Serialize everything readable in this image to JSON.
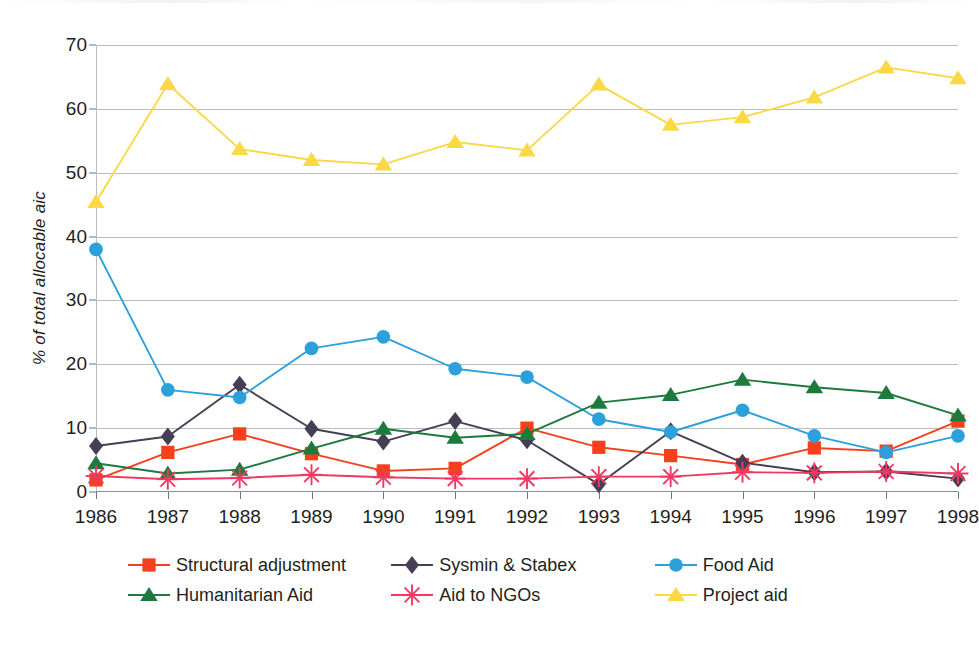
{
  "chart_data": {
    "type": "line",
    "title": "",
    "xlabel": "",
    "ylabel": "% of total allocable aic",
    "categories": [
      "1986",
      "1987",
      "1988",
      "1989",
      "1990",
      "1991",
      "1992",
      "1993",
      "1994",
      "1995",
      "1996",
      "1997",
      "1998"
    ],
    "ylim": [
      0,
      70
    ],
    "yticks": [
      0,
      10,
      20,
      30,
      40,
      50,
      60,
      70
    ],
    "grid": true,
    "legend_position": "bottom",
    "series": [
      {
        "name": "Structural adjustment",
        "color": "#F4401C",
        "marker": "square",
        "values": [
          1.9,
          6.2,
          9.1,
          6.0,
          3.3,
          3.7,
          10.0,
          7.0,
          5.7,
          4.3,
          6.9,
          6.4,
          11.1
        ]
      },
      {
        "name": "Sysmin & Stabex",
        "color": "#463E54",
        "marker": "diamond",
        "values": [
          7.2,
          8.7,
          16.8,
          9.9,
          7.9,
          11.1,
          8.1,
          1.2,
          9.5,
          4.6,
          3.1,
          3.2,
          2.1
        ]
      },
      {
        "name": "Food Aid",
        "color": "#2BA0DB",
        "marker": "circle",
        "values": [
          38.0,
          16.0,
          14.8,
          22.5,
          24.3,
          19.3,
          18.0,
          11.4,
          9.4,
          12.8,
          8.8,
          6.2,
          8.8
        ]
      },
      {
        "name": "Humanitarian Aid",
        "color": "#1E7A3C",
        "marker": "triangle",
        "values": [
          4.5,
          2.9,
          3.5,
          6.8,
          9.9,
          8.5,
          9.1,
          14.0,
          15.2,
          17.6,
          16.4,
          15.5,
          12.0
        ]
      },
      {
        "name": "Aid to NGOs",
        "color": "#EE3A63",
        "marker": "asterisk",
        "values": [
          2.5,
          2.0,
          2.2,
          2.7,
          2.3,
          2.1,
          2.1,
          2.4,
          2.4,
          3.1,
          3.0,
          3.2,
          2.9
        ]
      },
      {
        "name": "Project aid",
        "color": "#FAD846",
        "marker": "triangle",
        "values": [
          45.4,
          63.9,
          53.7,
          52.0,
          51.3,
          54.8,
          53.5,
          63.8,
          57.5,
          58.7,
          61.8,
          66.5,
          64.8
        ]
      }
    ]
  }
}
